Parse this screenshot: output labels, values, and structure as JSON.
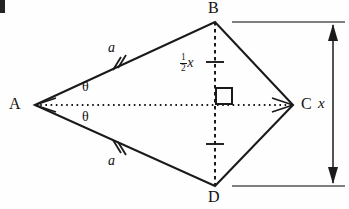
{
  "figure": {
    "vertices": [
      {
        "name": "A",
        "label": "A",
        "x": 35,
        "y": 105
      },
      {
        "name": "B",
        "label": "B",
        "x": 215,
        "y": 22
      },
      {
        "name": "C",
        "label": "C",
        "x": 293,
        "y": 105
      },
      {
        "name": "D",
        "label": "D",
        "x": 215,
        "y": 186
      }
    ],
    "side_labels": [
      {
        "name": "side-ab",
        "label": "a",
        "ticks": 2
      },
      {
        "name": "side-ad",
        "label": "a",
        "ticks": 2
      }
    ],
    "angle_labels": [
      {
        "name": "angle-upper",
        "label": "θ"
      },
      {
        "name": "angle-lower",
        "label": "θ"
      }
    ],
    "segment_label": {
      "name": "half-x",
      "numerator": "1",
      "denominator": "2",
      "variable": "x"
    },
    "dimension": {
      "name": "overall-height",
      "label": "x",
      "arrow": "double-headed"
    },
    "right_angle_marker": "square",
    "colors": {
      "stroke": "#1a1a1a",
      "background": "#fefefe"
    }
  }
}
